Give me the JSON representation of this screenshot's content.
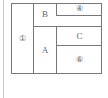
{
  "diagram": {
    "regions": [
      {
        "id": "r1",
        "label": "①"
      },
      {
        "id": "rB",
        "label": "B"
      },
      {
        "id": "r4",
        "label": "④"
      },
      {
        "id": "rA",
        "label": "A"
      },
      {
        "id": "rC",
        "label": "C"
      },
      {
        "id": "r6",
        "label": "⑥"
      }
    ],
    "colors": {
      "line": "#777777",
      "margin_line": "#c8c8c8",
      "text": "#666666"
    }
  }
}
